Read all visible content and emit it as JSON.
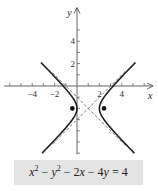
{
  "chart_data": {
    "type": "line",
    "title": "",
    "xlabel": "x",
    "ylabel": "y",
    "xlim": [
      -6.5,
      6.8
    ],
    "ylim": [
      -6.1,
      7.0
    ],
    "x_ticks": [
      -6,
      -5,
      -4,
      -3,
      -2,
      -1,
      1,
      2,
      3,
      4,
      5,
      6
    ],
    "x_tick_labels": [
      {
        "value": -4,
        "label": "−4"
      },
      {
        "value": -2,
        "label": "−2"
      },
      {
        "value": 2,
        "label": "2"
      },
      {
        "value": 4,
        "label": "4"
      }
    ],
    "y_ticks": [
      -6,
      -5,
      -4,
      -3,
      -2,
      -1,
      1,
      2,
      3,
      4,
      5
    ],
    "y_tick_labels": [
      {
        "value": 2,
        "label": "2"
      },
      {
        "value": 4,
        "label": "4"
      }
    ],
    "curve": {
      "name": "hyperbola",
      "equation": "x² − y² − 2x − 4y = 4",
      "center": [
        1,
        -2
      ],
      "a": 1,
      "b": 1,
      "y_range": [
        -6.0,
        2.1
      ],
      "style": "solid"
    },
    "asymptotes": [
      {
        "slope": 1,
        "through": [
          1,
          -2
        ],
        "x_range": [
          -2.2,
          4.3
        ],
        "style": "dashed"
      },
      {
        "slope": -1,
        "through": [
          1,
          -2
        ],
        "x_range": [
          -2.2,
          4.3
        ],
        "style": "dashed"
      }
    ],
    "points": [
      {
        "name": "focus-left",
        "x": -0.414,
        "y": -2
      },
      {
        "name": "focus-right",
        "x": 2.414,
        "y": -2
      }
    ],
    "grid": false,
    "legend": "none"
  },
  "equation_box": {
    "parts": [
      {
        "t": "x",
        "i": true
      },
      {
        "t": "2",
        "sup": true
      },
      {
        "t": " − "
      },
      {
        "t": "y",
        "i": true
      },
      {
        "t": "2",
        "sup": true
      },
      {
        "t": " − 2"
      },
      {
        "t": "x",
        "i": true
      },
      {
        "t": " − 4"
      },
      {
        "t": "y",
        "i": true
      },
      {
        "t": " = 4"
      }
    ]
  }
}
